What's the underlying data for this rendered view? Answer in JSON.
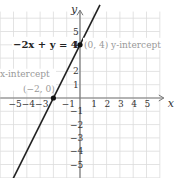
{
  "chart_data": {
    "type": "line",
    "title": "",
    "xlabel": "x",
    "ylabel": "y",
    "xlim": [
      -6,
      6
    ],
    "ylim": [
      -6,
      6
    ],
    "grid": true,
    "x_ticks": [
      "-5",
      "-4",
      "-3",
      "-1",
      "1",
      "2",
      "3",
      "4",
      "5"
    ],
    "y_ticks": [
      "5",
      "4",
      "2",
      "1",
      "-1",
      "-2",
      "-3",
      "-4",
      "-5"
    ],
    "series": [
      {
        "name": "-2x + y = 4",
        "equation": "y = 2x + 4",
        "points": [
          [
            -6,
            -8
          ],
          [
            1.5,
            7
          ]
        ]
      }
    ],
    "points": [
      {
        "x": 0,
        "y": 4,
        "label": "(0, 4) y-intercept"
      },
      {
        "x": -2,
        "y": 0,
        "label": "x-intercept (−2, 0)"
      }
    ],
    "annotations": {
      "equation": "−2x + y = 4",
      "y_intercept_coord": "(0, 4)",
      "y_intercept_label": "y-intercept",
      "x_intercept_label": "x-intercept",
      "x_intercept_coord": "(−2, 0)"
    }
  }
}
